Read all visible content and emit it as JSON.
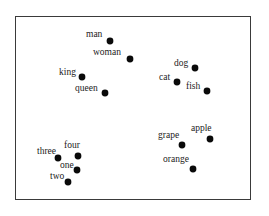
{
  "chart_data": {
    "type": "scatter",
    "title": "",
    "xlabel": "",
    "ylabel": "",
    "grid": false,
    "legend": null,
    "frame": {
      "x": 15,
      "y": 16,
      "width": 236,
      "height": 184
    },
    "clusters": [
      {
        "name": "people/royalty",
        "words": [
          "man",
          "woman",
          "king",
          "queen"
        ]
      },
      {
        "name": "animals",
        "words": [
          "dog",
          "cat",
          "fish"
        ]
      },
      {
        "name": "fruits",
        "words": [
          "apple",
          "grape",
          "orange"
        ]
      },
      {
        "name": "numbers",
        "words": [
          "one",
          "two",
          "three",
          "four"
        ]
      }
    ],
    "points": [
      {
        "label": "man",
        "x": 110,
        "y": 41,
        "label_dx": -24,
        "label_dy": -4
      },
      {
        "label": "woman",
        "x": 130,
        "y": 59,
        "label_dx": -37,
        "label_dy": -4
      },
      {
        "label": "king",
        "x": 82,
        "y": 77,
        "label_dx": -23,
        "label_dy": -2
      },
      {
        "label": "queen",
        "x": 105,
        "y": 93,
        "label_dx": -30,
        "label_dy": -2
      },
      {
        "label": "dog",
        "x": 195,
        "y": 68,
        "label_dx": -21,
        "label_dy": -2
      },
      {
        "label": "cat",
        "x": 177,
        "y": 82,
        "label_dx": -18,
        "label_dy": -2
      },
      {
        "label": "fish",
        "x": 207,
        "y": 91,
        "label_dx": -21,
        "label_dy": -2
      },
      {
        "label": "apple",
        "x": 210,
        "y": 139,
        "label_dx": -19,
        "label_dy": -8
      },
      {
        "label": "grape",
        "x": 182,
        "y": 145,
        "label_dx": -24,
        "label_dy": -7
      },
      {
        "label": "orange",
        "x": 193,
        "y": 169,
        "label_dx": -30,
        "label_dy": -7
      },
      {
        "label": "four",
        "x": 78,
        "y": 156,
        "label_dx": -14,
        "label_dy": -8
      },
      {
        "label": "three",
        "x": 58,
        "y": 158,
        "label_dx": -21,
        "label_dy": -4
      },
      {
        "label": "one",
        "x": 77,
        "y": 170,
        "label_dx": -17,
        "label_dy": -2
      },
      {
        "label": "two",
        "x": 68,
        "y": 182,
        "label_dx": -18,
        "label_dy": -3
      }
    ],
    "point_radius": 3.4,
    "point_color": "#0a0a0a",
    "label_color": "#222222",
    "frame_color": "#3a3a3a"
  }
}
